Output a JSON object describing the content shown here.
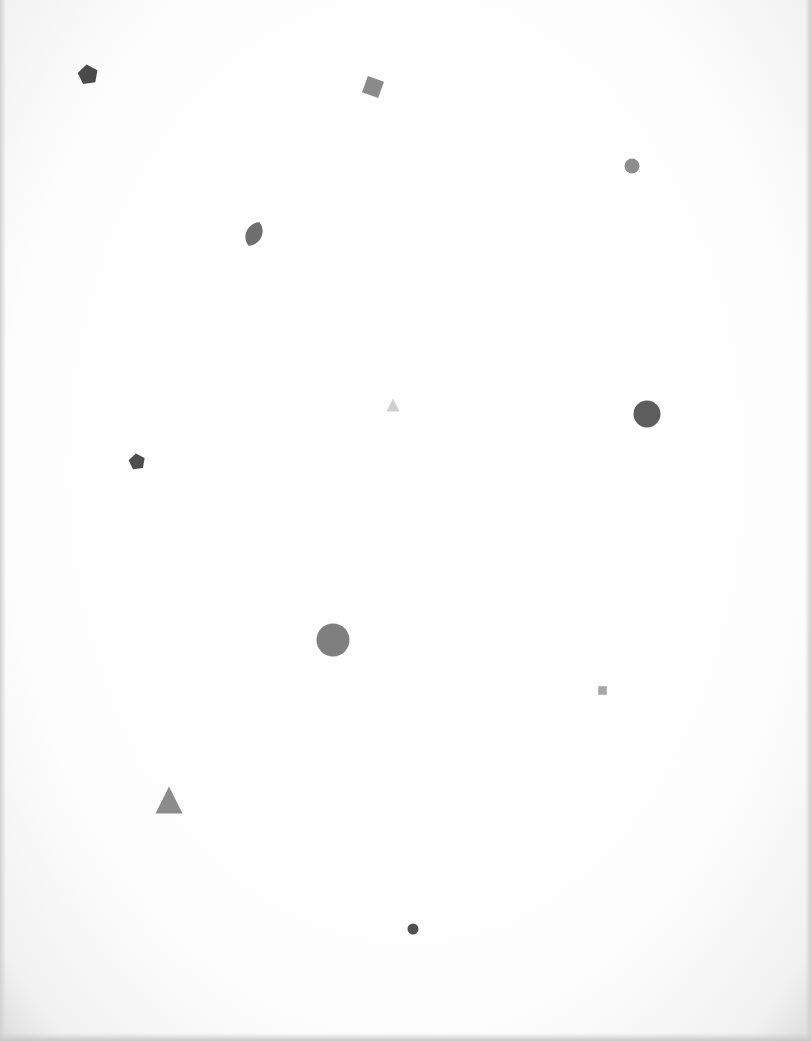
{
  "page": {
    "background": "#ffffff",
    "edge_shadow": "#d2d2d2"
  },
  "shapes": [
    {
      "id": "pentagon-1",
      "kind": "pentagon",
      "x": 88,
      "y": 74,
      "size": 22,
      "color": "#4a4a4a"
    },
    {
      "id": "square-1",
      "kind": "square",
      "x": 373,
      "y": 87,
      "size": 22,
      "rotation": 20,
      "color": "#8a8a8a"
    },
    {
      "id": "circle-small-1",
      "kind": "circle",
      "x": 632,
      "y": 166,
      "size": 16,
      "color": "#8d8d8d"
    },
    {
      "id": "leaf-1",
      "kind": "leaf",
      "x": 254,
      "y": 234,
      "size": 28,
      "color": "#6e6e6e"
    },
    {
      "id": "triangle-small-1",
      "kind": "triangle",
      "x": 393,
      "y": 405,
      "size": 14,
      "color": "#cfcfcf"
    },
    {
      "id": "circle-large-1",
      "kind": "circle",
      "x": 647,
      "y": 414,
      "size": 28,
      "color": "#5d5d5d"
    },
    {
      "id": "pentagon-2",
      "kind": "pentagon",
      "x": 137,
      "y": 461,
      "size": 18,
      "color": "#4e4e4e"
    },
    {
      "id": "circle-textured-1",
      "kind": "circle",
      "x": 333,
      "y": 640,
      "size": 34,
      "color": "#7f7f7f"
    },
    {
      "id": "square-small-1",
      "kind": "square",
      "x": 602,
      "y": 690,
      "size": 11,
      "rotation": 0,
      "color": "#a7a7a7"
    },
    {
      "id": "triangle-large-1",
      "kind": "triangle",
      "x": 169,
      "y": 800,
      "size": 28,
      "color": "#8b8b8b"
    },
    {
      "id": "dot-1",
      "kind": "circle",
      "x": 413,
      "y": 929,
      "size": 12,
      "color": "#505050"
    }
  ]
}
